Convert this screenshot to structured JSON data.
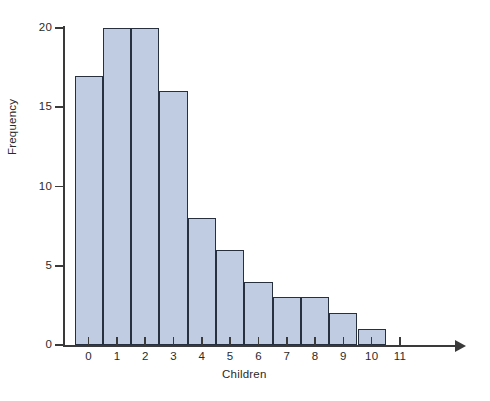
{
  "chart_data": {
    "type": "bar",
    "title": "",
    "subtitle": "",
    "xlabel": "Children",
    "ylabel": "Frequency",
    "categories": [
      "0",
      "1",
      "2",
      "3",
      "4",
      "5",
      "6",
      "7",
      "8",
      "9",
      "10"
    ],
    "values": [
      17,
      20,
      20,
      16,
      8,
      6,
      4,
      3,
      3,
      2,
      1
    ],
    "series": [
      {
        "name": "Frequency",
        "values": [
          17,
          20,
          20,
          16,
          8,
          6,
          4,
          3,
          3,
          2,
          1
        ]
      }
    ],
    "x_tick_labels": [
      "0",
      "1",
      "2",
      "3",
      "4",
      "5",
      "6",
      "7",
      "8",
      "9",
      "10",
      "11"
    ],
    "y_tick_labels": [
      "0",
      "5",
      "10",
      "15",
      "20"
    ],
    "y_tick_values": [
      0,
      5,
      10,
      15,
      20
    ],
    "xlim": [
      -0.5,
      11.5
    ],
    "ylim": [
      0,
      20
    ],
    "grid": false,
    "legend": false,
    "legend_position": "none",
    "bar_fill_color": "#bfcce2",
    "bar_edge_color": "#27303f",
    "axis_color": "#3a3a3a",
    "background_color": "#ffffff",
    "x_axis_has_arrow": true,
    "annotations": []
  }
}
